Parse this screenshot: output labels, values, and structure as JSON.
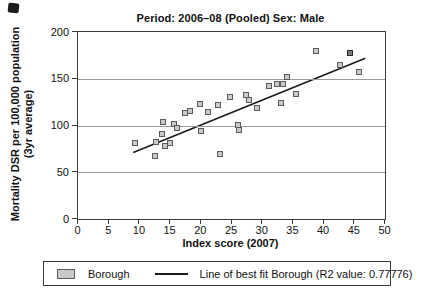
{
  "chart_data": {
    "type": "scatter",
    "title": "Period: 2006–08 (Pooled) Sex: Male",
    "xlabel": "Index score (2007)",
    "ylabel_line1": "Mortality DSR per 100,000 population",
    "ylabel_line2": "(3yr average)",
    "xlim": [
      0,
      50
    ],
    "ylim": [
      0,
      200
    ],
    "xticks": [
      0,
      5,
      10,
      15,
      20,
      25,
      30,
      35,
      40,
      45,
      50
    ],
    "yticks": [
      0,
      50,
      100,
      150,
      200
    ],
    "gridlines_y": [
      50,
      100,
      150
    ],
    "grid_color": "#9a9a9a",
    "legend_position": "bottom",
    "series": [
      {
        "name": "Borough",
        "marker": "square",
        "marker_fill": "#c9c9c9",
        "marker_stroke": "#5a5a5a",
        "points": [
          [
            9.3,
            81
          ],
          [
            12.5,
            67
          ],
          [
            12.7,
            82
          ],
          [
            13.7,
            91
          ],
          [
            14.2,
            78
          ],
          [
            15.0,
            81
          ],
          [
            13.8,
            104
          ],
          [
            15.7,
            102
          ],
          [
            16.2,
            97
          ],
          [
            17.5,
            113
          ],
          [
            18.3,
            116
          ],
          [
            19.8,
            123
          ],
          [
            20.1,
            94
          ],
          [
            21.2,
            114
          ],
          [
            22.8,
            122
          ],
          [
            23.1,
            69
          ],
          [
            24.7,
            130
          ],
          [
            26.0,
            101
          ],
          [
            26.2,
            95
          ],
          [
            27.4,
            133
          ],
          [
            27.9,
            127
          ],
          [
            29.2,
            119
          ],
          [
            31.1,
            142
          ],
          [
            32.4,
            144
          ],
          [
            33.0,
            124
          ],
          [
            33.4,
            144
          ],
          [
            34.1,
            152
          ],
          [
            35.5,
            134
          ],
          [
            38.8,
            180
          ],
          [
            42.6,
            165
          ],
          [
            44.3,
            178,
            1
          ],
          [
            45.7,
            157
          ]
        ]
      }
    ],
    "trend": {
      "name": "Line of best fit Borough (R2 value: 0.77776)",
      "r2_value": 0.77776,
      "x1": 9.0,
      "y1": 71,
      "x2": 46.8,
      "y2": 172,
      "color": "#1a1a1a"
    }
  }
}
